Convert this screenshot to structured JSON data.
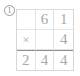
{
  "problem": {
    "number_label": "1",
    "number_style": "circled"
  },
  "calculation": {
    "type": "vertical-multiplication",
    "operand_top": "61",
    "operator": "×",
    "operand_bottom": "4",
    "answer": "244",
    "grid": {
      "columns": 3,
      "rows": 3,
      "cells": [
        [
          {
            "id": "r1c1",
            "text": "",
            "role": "empty"
          },
          {
            "id": "r1c2",
            "text": "6",
            "role": "multiplicand-tens"
          },
          {
            "id": "r1c3",
            "text": "1",
            "role": "multiplicand-ones"
          }
        ],
        [
          {
            "id": "r2c1",
            "text": "×",
            "role": "operator"
          },
          {
            "id": "r2c2",
            "text": "",
            "role": "empty"
          },
          {
            "id": "r2c3",
            "text": "4",
            "role": "multiplier-ones"
          }
        ],
        [
          {
            "id": "r3c1",
            "text": "2",
            "role": "answer-hundreds"
          },
          {
            "id": "r3c2",
            "text": "4",
            "role": "answer-tens"
          },
          {
            "id": "r3c3",
            "text": "4",
            "role": "answer-ones"
          }
        ]
      ]
    }
  },
  "colors": {
    "background": "#ffffff",
    "digit": "#a9a9a9",
    "grid_line": "#e2e2e2",
    "grid_border": "#d7d7d7",
    "answer_line": "#8f8f8f",
    "problem_number": "#8a8a8a"
  }
}
